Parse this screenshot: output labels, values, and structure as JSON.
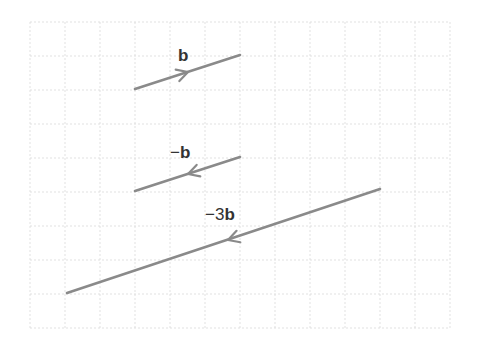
{
  "diagram": {
    "grid": {
      "x0": 30,
      "y0": 22,
      "cols": 12,
      "rows": 9,
      "cell": 35,
      "cell_y": 34
    },
    "vectors": [
      {
        "id": "b",
        "label_prefix": "",
        "label_bold": "b",
        "from": [
          135,
          89
        ],
        "to": [
          240,
          55
        ],
        "arrow_at": [
          188,
          72
        ],
        "direction": "forward",
        "label_pos": [
          178,
          61
        ]
      },
      {
        "id": "neg-b",
        "label_prefix": "−",
        "label_bold": "b",
        "from": [
          135,
          191
        ],
        "to": [
          240,
          157
        ],
        "arrow_at": [
          188,
          174
        ],
        "direction": "backward",
        "label_pos": [
          170,
          158
        ]
      },
      {
        "id": "neg-3b",
        "label_prefix": "−3",
        "label_bold": "b",
        "from": [
          67,
          293
        ],
        "to": [
          380,
          189
        ],
        "arrow_at": [
          228,
          240
        ],
        "direction": "backward",
        "label_pos": [
          205,
          220
        ]
      }
    ],
    "colors": {
      "vector": "#8a8a8a",
      "grid": "#d9d9d9",
      "label": "#333333"
    }
  }
}
